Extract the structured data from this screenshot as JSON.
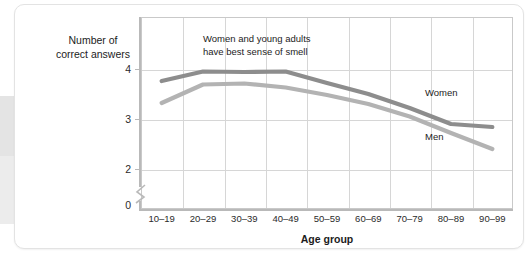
{
  "chart_data": {
    "type": "line",
    "title": "",
    "xlabel": "Age group",
    "ylabel": "Number of correct answers",
    "categories": [
      "10–19",
      "20–29",
      "30–39",
      "40–49",
      "50–59",
      "60–69",
      "70–79",
      "80–89",
      "90–99"
    ],
    "ytick_labels": [
      "0",
      "2",
      "3",
      "4"
    ],
    "ytick_values": [
      0,
      2,
      3,
      4
    ],
    "ylim": [
      2,
      4.55
    ],
    "y_axis_break": true,
    "grid": "both",
    "legend_position": "inline-right",
    "series": [
      {
        "name": "Women",
        "color": "#8d8d8d",
        "values": [
          3.76,
          3.95,
          3.94,
          3.95,
          3.72,
          3.5,
          3.22,
          2.9,
          2.84
        ]
      },
      {
        "name": "Men",
        "color": "#b3b3b3",
        "values": [
          3.32,
          3.69,
          3.71,
          3.63,
          3.48,
          3.3,
          3.05,
          2.72,
          2.4
        ]
      }
    ],
    "annotations": [
      {
        "text": "Women and young adults\nhave best sense of smell"
      }
    ]
  },
  "axes": {
    "y_title_line1": "Number of",
    "y_title_line2": "correct answers",
    "x_title": "Age group"
  }
}
